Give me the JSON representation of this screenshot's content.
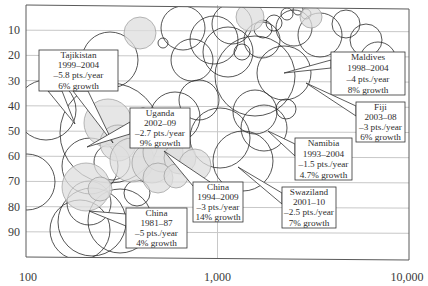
{
  "chart_data": {
    "type": "scatter",
    "subtype": "bubble",
    "title": "",
    "xlabel": "",
    "ylabel": "",
    "x_scale": "log",
    "xlim": [
      100,
      10000
    ],
    "ylim": [
      0,
      100
    ],
    "y_inverted": true,
    "grid": {
      "horizontal": true,
      "vertical_at": [
        1000
      ]
    },
    "x_ticks": [
      {
        "value": 100,
        "label": "100"
      },
      {
        "value": 1000,
        "label": "1,000"
      },
      {
        "value": 10000,
        "label": "10,000"
      }
    ],
    "y_ticks": [
      {
        "value": 10,
        "label": "10"
      },
      {
        "value": 20,
        "label": "20"
      },
      {
        "value": 30,
        "label": "30"
      },
      {
        "value": 40,
        "label": "40"
      },
      {
        "value": 50,
        "label": "50"
      },
      {
        "value": 60,
        "label": "60"
      },
      {
        "value": 70,
        "label": "70"
      },
      {
        "value": 80,
        "label": "80"
      },
      {
        "value": 90,
        "label": "90"
      }
    ],
    "colors": {
      "frame": "#5a5a5a",
      "grid": "#c8c8c8",
      "circle_stroke": "#2a2a2a",
      "circle_fill": "#ffffff",
      "highlight_fill": "#dedede",
      "highlight_stroke": "#9a9a9a",
      "text": "#333333"
    },
    "annotations": [
      {
        "name": "tajikistan",
        "lines": [
          "Tajikistan",
          "1999–2004",
          "–5.8 pts./year",
          "6% growth"
        ],
        "box": [
          39,
          50,
          79,
          41
        ],
        "pointer_from": [
          [
            48,
            91
          ],
          [
            62,
            91
          ]
        ],
        "pointer_to": [
          75,
          124
        ],
        "pointer_from2": [
          [
            73,
            91
          ],
          [
            88,
            91
          ]
        ],
        "pointer_to2": [
          113,
          143
        ]
      },
      {
        "name": "uganda",
        "lines": [
          "Uganda",
          "2002–09",
          "–2.7 pts./year",
          "9% growth"
        ],
        "box": [
          130,
          108,
          60,
          40
        ],
        "pointer_from": [
          [
            130,
            122
          ],
          [
            130,
            134
          ]
        ],
        "pointer_to": [
          87,
          147
        ]
      },
      {
        "name": "maldives",
        "lines": [
          "Maldives",
          "1998–2004",
          "–4 pts./year",
          "8% growth"
        ],
        "box": [
          331,
          52,
          74,
          43
        ],
        "pointer_from": [
          [
            331,
            60
          ],
          [
            331,
            68
          ]
        ],
        "pointer_to": [
          284,
          73
        ]
      },
      {
        "name": "fiji",
        "lines": [
          "Fiji",
          "2003–08",
          "–3 pts./year",
          "6% growth"
        ],
        "box": [
          356,
          102,
          49,
          40
        ],
        "pointer_from": [
          [
            356,
            106
          ],
          [
            356,
            116
          ]
        ],
        "pointer_to": [
          306,
          83
        ]
      },
      {
        "name": "namibia",
        "lines": [
          "Namibia",
          "1993–2004",
          "–1.5 pts./year",
          "4.7% growth"
        ],
        "box": [
          295,
          138,
          57,
          42
        ],
        "pointer_from": [
          [
            295,
            144
          ],
          [
            295,
            156
          ]
        ],
        "pointer_to": [
          268,
          131
        ]
      },
      {
        "name": "swaziland",
        "lines": [
          "Swaziland",
          "2001–10",
          "–2.5 pts./year",
          "7% growth"
        ],
        "box": [
          282,
          187,
          54,
          41
        ],
        "pointer_from": [
          [
            282,
            193
          ],
          [
            282,
            204
          ]
        ],
        "pointer_to": [
          238,
          167
        ]
      },
      {
        "name": "china-1994-2009",
        "lines": [
          "China",
          "1994–2009",
          "–3 pts./year",
          "14% growth"
        ],
        "box": [
          193,
          182,
          50,
          40
        ],
        "pointer_from": [
          [
            193,
            186
          ],
          [
            210,
            182
          ]
        ],
        "pointer_to": [
          164,
          151
        ]
      },
      {
        "name": "china-1981-87",
        "lines": [
          "China",
          "1981–87",
          "–5 pts./year",
          "4% growth"
        ],
        "box": [
          126,
          208,
          61,
          40
        ],
        "pointer_from": [
          [
            126,
            214
          ],
          [
            126,
            226
          ]
        ],
        "pointer_to": [
          89,
          211
        ]
      }
    ],
    "circles": [
      {
        "cx": 46,
        "cy": 110,
        "r": 30,
        "hl": false
      },
      {
        "cx": 110,
        "cy": 60,
        "r": 28,
        "hl": false
      },
      {
        "cx": 110,
        "cy": 133,
        "r": 50,
        "hl": false
      },
      {
        "cx": 140,
        "cy": 33,
        "r": 16,
        "hl": true
      },
      {
        "cx": 163,
        "cy": 43,
        "r": 5,
        "hl": false
      },
      {
        "cx": 183,
        "cy": 28,
        "r": 22,
        "hl": false
      },
      {
        "cx": 192,
        "cy": 60,
        "r": 21,
        "hl": false
      },
      {
        "cx": 214,
        "cy": 40,
        "r": 24,
        "hl": false
      },
      {
        "cx": 232,
        "cy": 24,
        "r": 20,
        "hl": false
      },
      {
        "cx": 250,
        "cy": 17,
        "r": 14,
        "hl": true
      },
      {
        "cx": 228,
        "cy": 52,
        "r": 25,
        "hl": false
      },
      {
        "cx": 263,
        "cy": 29,
        "r": 9,
        "hl": false
      },
      {
        "cx": 274,
        "cy": 23,
        "r": 8,
        "hl": false
      },
      {
        "cx": 262,
        "cy": 40,
        "r": 18,
        "hl": false
      },
      {
        "cx": 294,
        "cy": 28,
        "r": 18,
        "hl": false
      },
      {
        "cx": 287,
        "cy": 14,
        "r": 6,
        "hl": false
      },
      {
        "cx": 298,
        "cy": 10,
        "r": 5,
        "hl": false
      },
      {
        "cx": 306,
        "cy": 14,
        "r": 5,
        "hl": false
      },
      {
        "cx": 311,
        "cy": 17,
        "r": 11,
        "hl": true
      },
      {
        "cx": 320,
        "cy": 35,
        "r": 22,
        "hl": false
      },
      {
        "cx": 242,
        "cy": 52,
        "r": 8,
        "hl": false
      },
      {
        "cx": 255,
        "cy": 76,
        "r": 40,
        "hl": false
      },
      {
        "cx": 284,
        "cy": 73,
        "r": 27,
        "hl": false
      },
      {
        "cx": 255,
        "cy": 112,
        "r": 22,
        "hl": false
      },
      {
        "cx": 286,
        "cy": 109,
        "r": 10,
        "hl": false
      },
      {
        "cx": 264,
        "cy": 128,
        "r": 23,
        "hl": false
      },
      {
        "cx": 220,
        "cy": 138,
        "r": 30,
        "hl": false
      },
      {
        "cx": 243,
        "cy": 161,
        "r": 30,
        "hl": false
      },
      {
        "cx": 199,
        "cy": 100,
        "r": 20,
        "hl": false
      },
      {
        "cx": 175,
        "cy": 117,
        "r": 25,
        "hl": false
      },
      {
        "cx": 108,
        "cy": 123,
        "r": 24,
        "hl": true
      },
      {
        "cx": 118,
        "cy": 143,
        "r": 18,
        "hl": true
      },
      {
        "cx": 132,
        "cy": 160,
        "r": 22,
        "hl": true
      },
      {
        "cx": 152,
        "cy": 163,
        "r": 20,
        "hl": true
      },
      {
        "cx": 163,
        "cy": 152,
        "r": 20,
        "hl": true
      },
      {
        "cx": 180,
        "cy": 158,
        "r": 16,
        "hl": true
      },
      {
        "cx": 195,
        "cy": 165,
        "r": 16,
        "hl": true
      },
      {
        "cx": 158,
        "cy": 178,
        "r": 15,
        "hl": true
      },
      {
        "cx": 176,
        "cy": 176,
        "r": 12,
        "hl": true
      },
      {
        "cx": 90,
        "cy": 166,
        "r": 28,
        "hl": false
      },
      {
        "cx": 86,
        "cy": 187,
        "r": 24,
        "hl": true
      },
      {
        "cx": 100,
        "cy": 189,
        "r": 12,
        "hl": true
      },
      {
        "cx": 89,
        "cy": 203,
        "r": 22,
        "hl": false
      },
      {
        "cx": 92,
        "cy": 222,
        "r": 34,
        "hl": false
      },
      {
        "cx": 80,
        "cy": 230,
        "r": 30,
        "hl": false
      },
      {
        "cx": 120,
        "cy": 221,
        "r": 32,
        "hl": false
      },
      {
        "cx": 137,
        "cy": 193,
        "r": 13,
        "hl": false
      },
      {
        "cx": 112,
        "cy": 162,
        "r": 18,
        "hl": false
      },
      {
        "cx": 143,
        "cy": 120,
        "r": 12,
        "hl": false
      },
      {
        "cx": 27,
        "cy": 182,
        "r": 28,
        "hl": false
      },
      {
        "cx": 378,
        "cy": 60,
        "r": 18,
        "hl": false
      },
      {
        "cx": 346,
        "cy": 24,
        "r": 14,
        "hl": false
      },
      {
        "cx": 366,
        "cy": 40,
        "r": 16,
        "hl": false
      }
    ]
  }
}
